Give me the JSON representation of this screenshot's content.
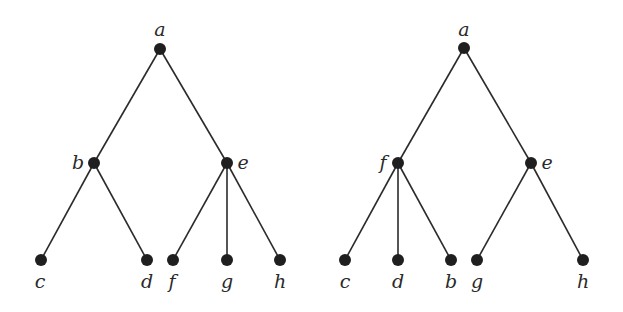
{
  "diagram": {
    "type": "rooted-trees",
    "colors": {
      "edge": "#2b2b2b",
      "node": "#1f1f1f",
      "label": "#2a2a2a",
      "background": "#ffffff"
    },
    "trees": [
      {
        "name": "left-tree",
        "nodes": [
          {
            "id": "a",
            "label": "a",
            "x": 160,
            "y": 49,
            "lx": 160,
            "ly": 36,
            "anchor": "middle"
          },
          {
            "id": "b",
            "label": "b",
            "x": 94,
            "y": 163,
            "lx": 78,
            "ly": 169,
            "anchor": "middle"
          },
          {
            "id": "e",
            "label": "e",
            "x": 227,
            "y": 163,
            "lx": 243,
            "ly": 169,
            "anchor": "middle"
          },
          {
            "id": "c",
            "label": "c",
            "x": 41,
            "y": 260,
            "lx": 40,
            "ly": 288,
            "anchor": "middle"
          },
          {
            "id": "d",
            "label": "d",
            "x": 147,
            "y": 260,
            "lx": 147,
            "ly": 288,
            "anchor": "middle"
          },
          {
            "id": "f",
            "label": "f",
            "x": 173,
            "y": 260,
            "lx": 172,
            "ly": 288,
            "anchor": "middle"
          },
          {
            "id": "g",
            "label": "g",
            "x": 227,
            "y": 260,
            "lx": 227,
            "ly": 288,
            "anchor": "middle"
          },
          {
            "id": "h",
            "label": "h",
            "x": 280,
            "y": 260,
            "lx": 280,
            "ly": 288,
            "anchor": "middle"
          }
        ],
        "edges": [
          [
            "a",
            "b"
          ],
          [
            "a",
            "e"
          ],
          [
            "b",
            "c"
          ],
          [
            "b",
            "d"
          ],
          [
            "e",
            "f"
          ],
          [
            "e",
            "g"
          ],
          [
            "e",
            "h"
          ]
        ]
      },
      {
        "name": "right-tree",
        "nodes": [
          {
            "id": "a",
            "label": "a",
            "x": 464,
            "y": 48,
            "lx": 464,
            "ly": 36,
            "anchor": "middle"
          },
          {
            "id": "f",
            "label": "f",
            "x": 398,
            "y": 163,
            "lx": 383,
            "ly": 169,
            "anchor": "middle"
          },
          {
            "id": "e",
            "label": "e",
            "x": 531,
            "y": 163,
            "lx": 547,
            "ly": 169,
            "anchor": "middle"
          },
          {
            "id": "c",
            "label": "c",
            "x": 345,
            "y": 260,
            "lx": 345,
            "ly": 288,
            "anchor": "middle"
          },
          {
            "id": "d",
            "label": "d",
            "x": 398,
            "y": 260,
            "lx": 398,
            "ly": 288,
            "anchor": "middle"
          },
          {
            "id": "b",
            "label": "b",
            "x": 451,
            "y": 260,
            "lx": 451,
            "ly": 288,
            "anchor": "middle"
          },
          {
            "id": "g",
            "label": "g",
            "x": 477,
            "y": 260,
            "lx": 477,
            "ly": 288,
            "anchor": "middle"
          },
          {
            "id": "h",
            "label": "h",
            "x": 583,
            "y": 260,
            "lx": 583,
            "ly": 288,
            "anchor": "middle"
          }
        ],
        "edges": [
          [
            "a",
            "f"
          ],
          [
            "a",
            "e"
          ],
          [
            "f",
            "c"
          ],
          [
            "f",
            "d"
          ],
          [
            "f",
            "b"
          ],
          [
            "e",
            "g"
          ],
          [
            "e",
            "h"
          ]
        ]
      }
    ]
  }
}
